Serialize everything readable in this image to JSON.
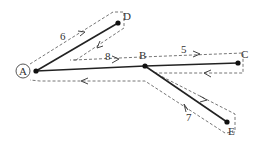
{
  "diagram": {
    "type": "tree-traversal",
    "nodes": [
      {
        "id": "A",
        "label": "A",
        "circled": true
      },
      {
        "id": "B",
        "label": "B"
      },
      {
        "id": "C",
        "label": "C"
      },
      {
        "id": "D",
        "label": "D"
      },
      {
        "id": "E",
        "label": "E"
      }
    ],
    "edges": [
      {
        "from": "A",
        "to": "D"
      },
      {
        "from": "A",
        "to": "B"
      },
      {
        "from": "B",
        "to": "C"
      },
      {
        "from": "B",
        "to": "E"
      }
    ],
    "traversal_labels": {
      "AD": "6",
      "AB": "8",
      "BC": "5",
      "BE": "7"
    }
  }
}
